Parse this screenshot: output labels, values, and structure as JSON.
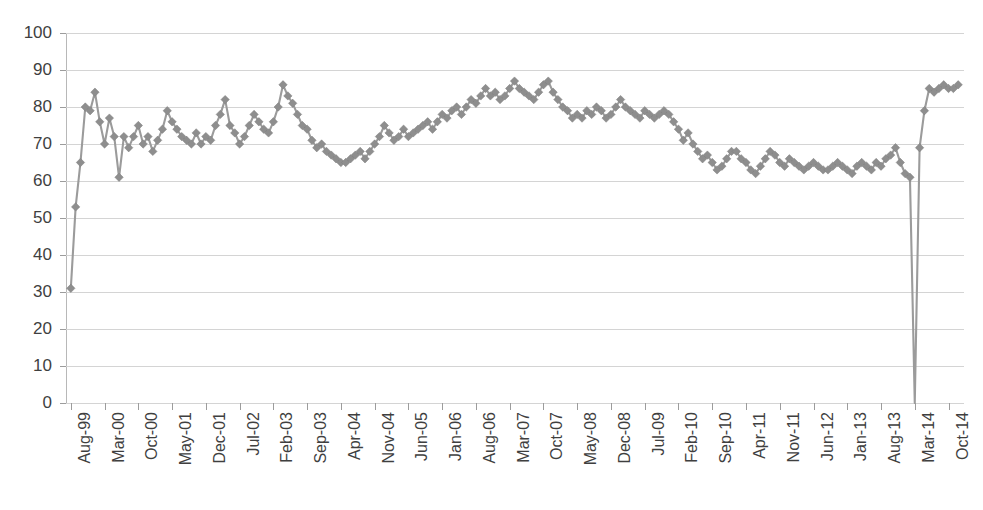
{
  "chart_data": {
    "type": "line",
    "title": "",
    "subtitle": "",
    "xlabel": "",
    "ylabel": "",
    "ylim": [
      0,
      100
    ],
    "y_ticks": [
      0,
      10,
      20,
      30,
      40,
      50,
      60,
      70,
      80,
      90,
      100
    ],
    "grid": true,
    "legend": "none",
    "marker": "diamond",
    "series_color": "#8e8e8e",
    "x_tick_labels": [
      "Aug-99",
      "Mar-00",
      "Oct-00",
      "May-01",
      "Dec-01",
      "Jul-02",
      "Feb-03",
      "Sep-03",
      "Apr-04",
      "Nov-04",
      "Jun-05",
      "Jan-06",
      "Aug-06",
      "Mar-07",
      "Oct-07",
      "May-08",
      "Dec-08",
      "Jul-09",
      "Feb-10",
      "Sep-10",
      "Apr-11",
      "Nov-11",
      "Jun-12",
      "Jan-13",
      "Aug-13",
      "Mar-14",
      "Oct-14"
    ],
    "x_tick_interval_months": 7,
    "x_start": "Aug-99",
    "series": [
      {
        "name": "value",
        "values": [
          31,
          53,
          65,
          80,
          79,
          84,
          76,
          70,
          77,
          72,
          61,
          72,
          69,
          72,
          75,
          70,
          72,
          68,
          71,
          74,
          79,
          76,
          74,
          72,
          71,
          70,
          73,
          70,
          72,
          71,
          75,
          78,
          82,
          75,
          73,
          70,
          72,
          75,
          78,
          76,
          74,
          73,
          76,
          80,
          86,
          83,
          81,
          78,
          75,
          74,
          71,
          69,
          70,
          68,
          67,
          66,
          65,
          65,
          66,
          67,
          68,
          66,
          68,
          70,
          72,
          75,
          73,
          71,
          72,
          74,
          72,
          73,
          74,
          75,
          76,
          74,
          76,
          78,
          77,
          79,
          80,
          78,
          80,
          82,
          81,
          83,
          85,
          83,
          84,
          82,
          83,
          85,
          87,
          85,
          84,
          83,
          82,
          84,
          86,
          87,
          84,
          82,
          80,
          79,
          77,
          78,
          77,
          79,
          78,
          80,
          79,
          77,
          78,
          80,
          82,
          80,
          79,
          78,
          77,
          79,
          78,
          77,
          78,
          79,
          78,
          76,
          74,
          71,
          73,
          70,
          68,
          66,
          67,
          65,
          63,
          64,
          66,
          68,
          68,
          66,
          65,
          63,
          62,
          64,
          66,
          68,
          67,
          65,
          64,
          66,
          65,
          64,
          63,
          64,
          65,
          64,
          63,
          63,
          64,
          65,
          64,
          63,
          62,
          64,
          65,
          64,
          63,
          65,
          64,
          66,
          67,
          69,
          65,
          62,
          61,
          0,
          69,
          79,
          85,
          84,
          85,
          86,
          85,
          85,
          86
        ]
      }
    ]
  }
}
